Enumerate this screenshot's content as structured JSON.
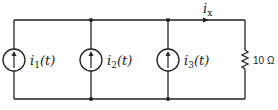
{
  "diagram": {
    "type": "circuit",
    "sources": [
      {
        "label_main": "i",
        "label_sub": "1",
        "label_arg": "(t)",
        "type": "current-source",
        "direction": "up"
      },
      {
        "label_main": "i",
        "label_sub": "2",
        "label_arg": "(t)",
        "type": "current-source",
        "direction": "up"
      },
      {
        "label_main": "i",
        "label_sub": "3",
        "label_arg": "(t)",
        "type": "current-source",
        "direction": "up"
      }
    ],
    "resistor": {
      "label": "10 Ω"
    },
    "current_label": {
      "main": "i",
      "sub": "x"
    },
    "colors": {
      "wire": "#222222",
      "background": "#ffffff"
    }
  }
}
